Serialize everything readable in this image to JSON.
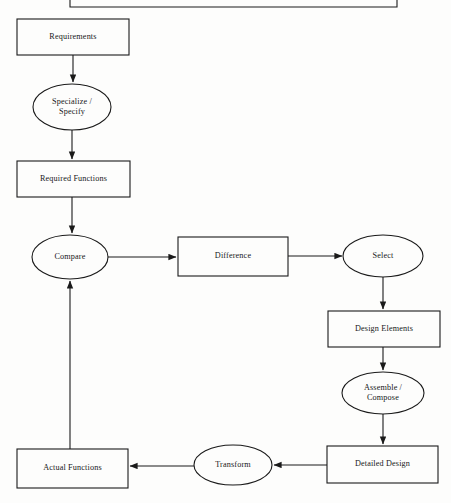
{
  "diagram": {
    "background_color": "#fdfdfc",
    "stroke_color": "#1a1a1a",
    "text_color": "#17181a",
    "nodes": [
      {
        "id": "top-partial",
        "label": "",
        "shape": "rectangle",
        "note": "partially cropped box at top edge, only bottom border visible",
        "x": 70,
        "y": -40,
        "w": 327,
        "h": 47
      },
      {
        "id": "requirements",
        "label": "Requirements",
        "shape": "rectangle",
        "x": 17,
        "y": 19,
        "w": 112,
        "h": 36
      },
      {
        "id": "specialize-specify",
        "label": "Specialize /\nSpecify",
        "shape": "ellipse",
        "cx": 72,
        "cy": 107,
        "rx": 39,
        "ry": 23
      },
      {
        "id": "required-functions",
        "label": "Required Functions",
        "shape": "rectangle",
        "x": 17,
        "y": 161,
        "w": 113,
        "h": 36
      },
      {
        "id": "compare",
        "label": "Compare",
        "shape": "ellipse",
        "cx": 70,
        "cy": 257,
        "rx": 38,
        "ry": 22
      },
      {
        "id": "difference",
        "label": "Difference",
        "shape": "rectangle",
        "x": 178,
        "y": 237,
        "w": 110,
        "h": 39
      },
      {
        "id": "select",
        "label": "Select",
        "shape": "ellipse",
        "cx": 383,
        "cy": 256,
        "rx": 40,
        "ry": 21
      },
      {
        "id": "design-elements",
        "label": "Design Elements",
        "shape": "rectangle",
        "x": 328,
        "y": 311,
        "w": 112,
        "h": 36
      },
      {
        "id": "assemble-compose",
        "label": "Assemble /\nCompose",
        "shape": "ellipse",
        "cx": 383,
        "cy": 393,
        "rx": 41,
        "ry": 21
      },
      {
        "id": "detailed-design",
        "label": "Detailed Design",
        "shape": "rectangle",
        "x": 327,
        "y": 446,
        "w": 111,
        "h": 37
      },
      {
        "id": "transform",
        "label": "Transform",
        "shape": "ellipse",
        "cx": 233,
        "cy": 465,
        "rx": 39,
        "ry": 20
      },
      {
        "id": "actual-functions",
        "label": "Actual Functions",
        "shape": "rectangle",
        "x": 17,
        "y": 449,
        "w": 111,
        "h": 39
      }
    ],
    "edges": [
      {
        "id": "requirements-to-specialize",
        "from": "requirements",
        "to": "specialize-specify",
        "direction": "down"
      },
      {
        "id": "specialize-to-required-functions",
        "from": "specialize-specify",
        "to": "required-functions",
        "direction": "down"
      },
      {
        "id": "required-functions-to-compare",
        "from": "required-functions",
        "to": "compare",
        "direction": "down"
      },
      {
        "id": "compare-to-difference",
        "from": "compare",
        "to": "difference",
        "direction": "right"
      },
      {
        "id": "difference-to-select",
        "from": "difference",
        "to": "select",
        "direction": "right"
      },
      {
        "id": "select-to-design-elements",
        "from": "select",
        "to": "design-elements",
        "direction": "down"
      },
      {
        "id": "design-elements-to-assemble",
        "from": "design-elements",
        "to": "assemble-compose",
        "direction": "down"
      },
      {
        "id": "assemble-to-detailed-design",
        "from": "assemble-compose",
        "to": "detailed-design",
        "direction": "down"
      },
      {
        "id": "detailed-design-to-transform",
        "from": "detailed-design",
        "to": "transform",
        "direction": "left"
      },
      {
        "id": "transform-to-actual-functions",
        "from": "transform",
        "to": "actual-functions",
        "direction": "left"
      },
      {
        "id": "actual-functions-to-compare",
        "from": "actual-functions",
        "to": "compare",
        "direction": "up",
        "note": "feedback loop"
      }
    ]
  }
}
